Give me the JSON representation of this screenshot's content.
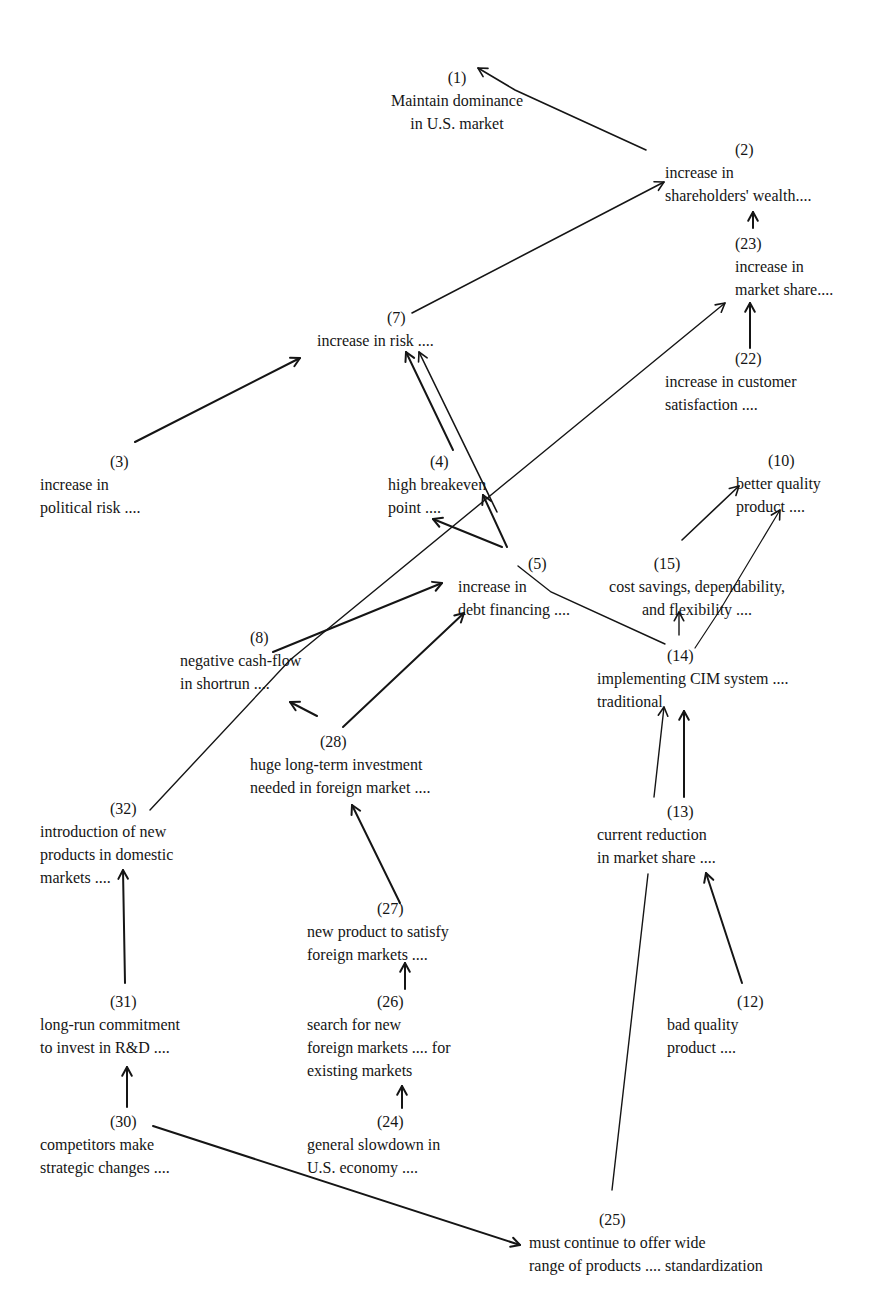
{
  "diagram": {
    "ink_color": "#151515",
    "background": "#ffffff",
    "nodes": [
      {
        "id": "1",
        "num": "(1)",
        "lines": [
          "Maintain dominance",
          "in U.S. market"
        ],
        "x": 373,
        "y": 66,
        "align": "center",
        "num_dx": 0,
        "w": 168
      },
      {
        "id": "2",
        "num": "(2)",
        "lines": [
          "increase in",
          "shareholders' wealth...."
        ],
        "x": 665,
        "y": 138,
        "num_dx": 70
      },
      {
        "id": "23",
        "num": "(23)",
        "lines": [
          "increase in",
          "market share...."
        ],
        "x": 735,
        "y": 232,
        "num_dx": 0
      },
      {
        "id": "22",
        "num": "(22)",
        "lines": [
          "increase in customer",
          "satisfaction ...."
        ],
        "x": 665,
        "y": 347,
        "num_dx": 70
      },
      {
        "id": "7",
        "num": "(7)",
        "lines": [
          "increase in risk ...."
        ],
        "x": 317,
        "y": 306,
        "num_dx": 70
      },
      {
        "id": "3",
        "num": "(3)",
        "lines": [
          "increase in",
          "political risk ...."
        ],
        "x": 40,
        "y": 450,
        "num_dx": 70
      },
      {
        "id": "4",
        "num": "(4)",
        "lines": [
          "high breakeven",
          "point ...."
        ],
        "x": 388,
        "y": 450,
        "num_dx": 42
      },
      {
        "id": "10",
        "num": "(10)",
        "lines": [
          "better quality",
          "product ...."
        ],
        "x": 736,
        "y": 449,
        "num_dx": 32
      },
      {
        "id": "5",
        "num": "(5)",
        "lines": [
          "increase in",
          "debt financing ...."
        ],
        "x": 458,
        "y": 552,
        "num_dx": 70
      },
      {
        "id": "15",
        "num": "(15)",
        "lines": [
          "cost savings, dependability,",
          "and flexibility ...."
        ],
        "x": 597,
        "y": 552,
        "align": "center",
        "w": 200,
        "num_dx": -30
      },
      {
        "id": "14",
        "num": "(14)",
        "lines": [
          "implementing CIM system ....",
          "traditional"
        ],
        "x": 597,
        "y": 644,
        "num_dx": 70
      },
      {
        "id": "8",
        "num": "(8)",
        "lines": [
          "negative cash-flow",
          "in shortrun ...."
        ],
        "x": 180,
        "y": 626,
        "num_dx": 70
      },
      {
        "id": "28",
        "num": "(28)",
        "lines": [
          "huge long-term investment",
          "needed in foreign market ...."
        ],
        "x": 250,
        "y": 730,
        "num_dx": 70
      },
      {
        "id": "32",
        "num": "(32)",
        "lines": [
          "introduction of new",
          "products in domestic",
          "markets ...."
        ],
        "x": 40,
        "y": 797,
        "num_dx": 70
      },
      {
        "id": "13",
        "num": "(13)",
        "lines": [
          "current reduction",
          "in market share ...."
        ],
        "x": 597,
        "y": 800,
        "num_dx": 70
      },
      {
        "id": "27",
        "num": "(27)",
        "lines": [
          "new product to satisfy",
          "foreign markets ...."
        ],
        "x": 307,
        "y": 897,
        "num_dx": 70
      },
      {
        "id": "31",
        "num": "(31)",
        "lines": [
          "long-run commitment",
          "to invest in R&D ...."
        ],
        "x": 40,
        "y": 990,
        "num_dx": 70
      },
      {
        "id": "26",
        "num": "(26)",
        "lines": [
          "search for new",
          "foreign markets .... for",
          "existing markets"
        ],
        "x": 307,
        "y": 990,
        "num_dx": 70
      },
      {
        "id": "12",
        "num": "(12)",
        "lines": [
          "bad quality",
          "product ...."
        ],
        "x": 667,
        "y": 990,
        "num_dx": 70
      },
      {
        "id": "30",
        "num": "(30)",
        "lines": [
          "competitors make",
          "strategic changes ...."
        ],
        "x": 40,
        "y": 1110,
        "num_dx": 70
      },
      {
        "id": "24",
        "num": "(24)",
        "lines": [
          "general slowdown in",
          "U.S. economy ...."
        ],
        "x": 307,
        "y": 1110,
        "num_dx": 70
      },
      {
        "id": "25",
        "num": "(25)",
        "lines": [
          "must continue to offer wide",
          "range of products .... standardization"
        ],
        "x": 529,
        "y": 1208,
        "num_dx": 70
      }
    ],
    "edges": [
      {
        "from": "2",
        "to": "1",
        "points": [
          [
            646,
            150
          ],
          [
            515,
            90
          ],
          [
            478,
            68
          ]
        ],
        "arrow": true,
        "width": 1.6
      },
      {
        "from": "7",
        "to": "2",
        "points": [
          [
            412,
            313
          ],
          [
            664,
            182
          ]
        ],
        "arrow": true,
        "width": 1.6
      },
      {
        "from": "23",
        "to": "2",
        "points": [
          [
            753,
            228
          ],
          [
            753,
            212
          ]
        ],
        "arrow": true,
        "width": 2
      },
      {
        "from": "22",
        "to": "23",
        "points": [
          [
            750,
            348
          ],
          [
            750,
            303
          ]
        ],
        "arrow": true,
        "width": 2
      },
      {
        "from": "32",
        "to": "23",
        "points": [
          [
            150,
            810
          ],
          [
            290,
            660
          ],
          [
            725,
            303
          ]
        ],
        "arrow": true,
        "width": 1.4
      },
      {
        "from": "3",
        "to": "7",
        "points": [
          [
            135,
            442
          ],
          [
            300,
            358
          ]
        ],
        "arrow": true,
        "width": 2
      },
      {
        "from": "4",
        "to": "7",
        "points": [
          [
            453,
            450
          ],
          [
            406,
            352
          ]
        ],
        "arrow": true,
        "width": 2
      },
      {
        "from": "5",
        "to": "7",
        "points": [
          [
            497,
            512
          ],
          [
            419,
            352
          ]
        ],
        "arrow": true,
        "width": 1.6
      },
      {
        "from": "5",
        "to": "4",
        "points": [
          [
            502,
            547
          ],
          [
            433,
            519
          ]
        ],
        "arrow": true,
        "width": 2
      },
      {
        "from": "5b",
        "to": "4",
        "points": [
          [
            507,
            547
          ],
          [
            483,
            495
          ]
        ],
        "arrow": true,
        "width": 2
      },
      {
        "from": "15",
        "to": "10",
        "points": [
          [
            682,
            540
          ],
          [
            739,
            486
          ]
        ],
        "arrow": true,
        "width": 1.6
      },
      {
        "from": "14",
        "to": "10",
        "points": [
          [
            695,
            648
          ],
          [
            720,
            610
          ],
          [
            780,
            510
          ]
        ],
        "arrow": true,
        "width": 1.2
      },
      {
        "from": "14",
        "to": "15",
        "points": [
          [
            679,
            635
          ],
          [
            679,
            612
          ]
        ],
        "arrow": true,
        "width": 1.4
      },
      {
        "from": "14",
        "to": "5",
        "points": [
          [
            665,
            644
          ],
          [
            551,
            592
          ],
          [
            518,
            566
          ]
        ],
        "arrow": false,
        "width": 1.4
      },
      {
        "from": "8",
        "to": "5",
        "points": [
          [
            273,
            652
          ],
          [
            442,
            583
          ]
        ],
        "arrow": true,
        "width": 2
      },
      {
        "from": "28",
        "to": "8",
        "points": [
          [
            317,
            716
          ],
          [
            290,
            702
          ]
        ],
        "arrow": true,
        "width": 2
      },
      {
        "from": "28",
        "to": "5",
        "points": [
          [
            343,
            727
          ],
          [
            464,
            613
          ]
        ],
        "arrow": true,
        "width": 2
      },
      {
        "from": "13",
        "to": "14",
        "points": [
          [
            654,
            797
          ],
          [
            664,
            707
          ]
        ],
        "arrow": true,
        "width": 1.4
      },
      {
        "from": "13b",
        "to": "14",
        "points": [
          [
            684,
            797
          ],
          [
            684,
            711
          ]
        ],
        "arrow": true,
        "width": 2
      },
      {
        "from": "12",
        "to": "13",
        "points": [
          [
            742,
            983
          ],
          [
            706,
            873
          ]
        ],
        "arrow": true,
        "width": 2
      },
      {
        "from": "25",
        "to": "13",
        "points": [
          [
            612,
            1190
          ],
          [
            648,
            874
          ]
        ],
        "arrow": false,
        "width": 1.4
      },
      {
        "from": "27",
        "to": "28",
        "points": [
          [
            400,
            903
          ],
          [
            352,
            805
          ]
        ],
        "arrow": true,
        "width": 2
      },
      {
        "from": "26",
        "to": "27",
        "points": [
          [
            405,
            989
          ],
          [
            405,
            963
          ]
        ],
        "arrow": true,
        "width": 2
      },
      {
        "from": "24",
        "to": "26",
        "points": [
          [
            402,
            1108
          ],
          [
            402,
            1086
          ]
        ],
        "arrow": true,
        "width": 2
      },
      {
        "from": "31",
        "to": "32",
        "points": [
          [
            125,
            983
          ],
          [
            123,
            870
          ]
        ],
        "arrow": true,
        "width": 2
      },
      {
        "from": "30",
        "to": "31",
        "points": [
          [
            127,
            1107
          ],
          [
            127,
            1067
          ]
        ],
        "arrow": true,
        "width": 2
      },
      {
        "from": "30",
        "to": "25",
        "points": [
          [
            153,
            1126
          ],
          [
            520,
            1245
          ]
        ],
        "arrow": true,
        "width": 2
      }
    ]
  }
}
